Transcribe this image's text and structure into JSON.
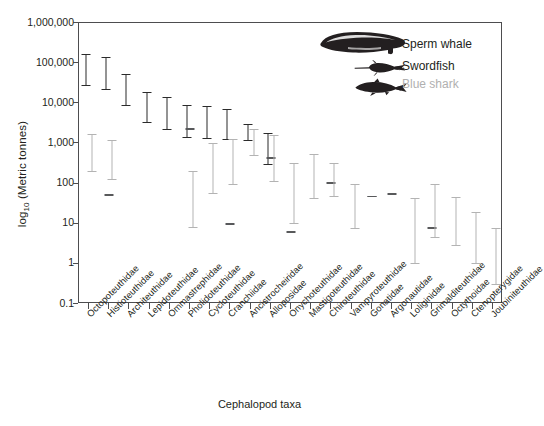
{
  "chart_data": {
    "type": "bar",
    "title": "",
    "xlabel": "Cephalopod taxa",
    "ylabel_prefix": "log",
    "ylabel_sub": "10",
    "ylabel_suffix": " (Metric tonnes)",
    "yscale": "log",
    "ylim": [
      0.1,
      1000000
    ],
    "yticks": [
      1000000,
      100000,
      10000,
      1000,
      100,
      10,
      1,
      0.1
    ],
    "ytick_labels": [
      "1,000,000",
      "100,000",
      "10,000",
      "1,000",
      "100",
      "10",
      "1",
      "0.1"
    ],
    "grid": false,
    "legend_position": "top-right",
    "categories": [
      "Octopoteuthidae",
      "Histioteuthidae",
      "Architeuthidae",
      "Lepidoteuthidae",
      "Ommastrephidae",
      "Pholidoteuthidae",
      "Cycloteuthidae",
      "Cranchiidae",
      "Ancistrocheiridae",
      "Alloposidae",
      "Onychoteuthidae",
      "Mastigoteuthidae",
      "Chiroteuthidae",
      "Vampyroteuthidae",
      "Gonatidae",
      "Argonautidae",
      "Loliginidae",
      "Grimalditeuthidae",
      "Octythoidae",
      "Ctenopterygidae",
      "Joubiniteuthidae"
    ],
    "series": [
      {
        "name": "Sperm whale",
        "color": "#2b2b2b",
        "ranges": [
          [
            27000,
            170000
          ],
          [
            22000,
            140000
          ],
          [
            8500,
            55000
          ],
          [
            3200,
            19000
          ],
          [
            2100,
            14500
          ],
          [
            1400,
            9300
          ],
          [
            1300,
            8600
          ],
          [
            1200,
            7300
          ],
          [
            1150,
            3000
          ],
          [
            290,
            1800
          ],
          [
            null,
            null
          ],
          [
            null,
            null
          ],
          [
            null,
            null
          ],
          [
            null,
            null
          ],
          [
            null,
            null
          ],
          [
            null,
            null
          ],
          [
            null,
            null
          ],
          [
            null,
            null
          ],
          [
            null,
            null
          ],
          [
            null,
            null
          ],
          [
            null,
            null
          ]
        ]
      },
      {
        "name": "Swordfish",
        "color": "#58595b",
        "ranges": [
          [
            null,
            null
          ],
          [
            50,
            55
          ],
          [
            null,
            null
          ],
          [
            null,
            null
          ],
          [
            null,
            null
          ],
          [
            2100,
            2450
          ],
          [
            null,
            null
          ],
          [
            9.5,
            10.5
          ],
          [
            null,
            null
          ],
          [
            400,
            470
          ],
          [
            6.0,
            6.5
          ],
          [
            null,
            null
          ],
          [
            96,
            110
          ],
          [
            null,
            null
          ],
          [
            46,
            50
          ],
          [
            53,
            58
          ],
          [
            null,
            null
          ],
          [
            7.5,
            8.3
          ],
          [
            null,
            null
          ],
          [
            null,
            null
          ],
          [
            null,
            null
          ]
        ]
      },
      {
        "name": "Blue shark",
        "color": "#b3b3b3",
        "ranges": [
          [
            190,
            1700
          ],
          [
            120,
            1250
          ],
          [
            null,
            null
          ],
          [
            null,
            null
          ],
          [
            null,
            null
          ],
          [
            8.0,
            200
          ],
          [
            55,
            1000
          ],
          [
            90,
            1300
          ],
          [
            480,
            2300
          ],
          [
            110,
            1600
          ],
          [
            10,
            330
          ],
          [
            42,
            560
          ],
          [
            46,
            320
          ],
          [
            7.5,
            95
          ],
          [
            null,
            null
          ],
          [
            null,
            null
          ],
          [
            1.0,
            43
          ],
          [
            4.5,
            95
          ],
          [
            2.8,
            47
          ],
          [
            1.0,
            20
          ],
          [
            0.3,
            8.0
          ]
        ]
      }
    ]
  },
  "legend": {
    "items": [
      {
        "label": "Sperm whale",
        "icon": "sperm-whale-icon",
        "color": "#231f20"
      },
      {
        "label": "Swordfish",
        "icon": "swordfish-icon",
        "color": "#231f20"
      },
      {
        "label": "Blue shark",
        "icon": "blue-shark-icon",
        "color": "#b0b0b0"
      }
    ]
  },
  "axes": {
    "frame_color": "#4d4d4f"
  }
}
